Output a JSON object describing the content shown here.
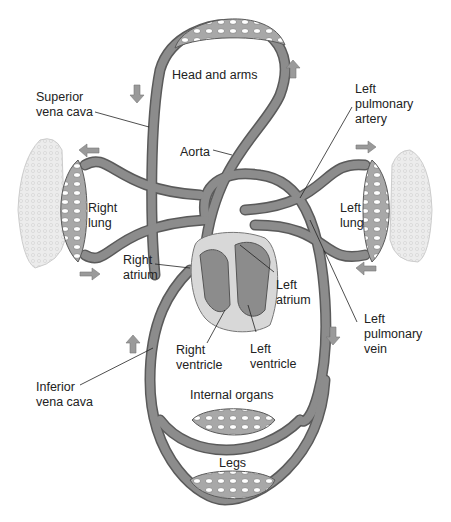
{
  "colors": {
    "vessel_fill": "#8c8c8c",
    "vessel_stroke": "#5a5a5a",
    "capillary_fill": "#b0b0b0",
    "heart_bg": "#d8d8d8",
    "lung_fill": "#e8e8e8",
    "arrow_fill": "#9a9a9a",
    "text": "#222222"
  },
  "labels": {
    "head_and_arms": "Head and arms",
    "superior_vena_cava": "Superior\nvena cava",
    "aorta": "Aorta",
    "left_pulmonary_artery": "Left\npulmonary\nartery",
    "right_lung": "Right\nlung",
    "left_lung": "Left\nlung",
    "right_atrium": "Right\natrium",
    "left_atrium": "Left\natrium",
    "left_pulmonary_vein": "Left\npulmonary\nvein",
    "right_ventricle": "Right\nventricle",
    "left_ventricle": "Left\nventricle",
    "inferior_vena_cava": "Inferior\nvena cava",
    "internal_organs": "Internal organs",
    "legs": "Legs"
  }
}
